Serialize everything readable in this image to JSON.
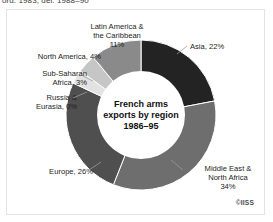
{
  "caption_above": "ord. 1983, del. 1988–90",
  "credit": "©IISS",
  "center": {
    "line1": "French arms",
    "line2": "exports by region",
    "line3": "1986–95"
  },
  "labels": {
    "latin": "Latin America &\nthe Caribbean\n11%",
    "north_america": "North America, 4%",
    "sub_saharan": "Sub-Saharan\nAfrica, 3%",
    "russia": "Russia &\nEurasia, 0%",
    "europe": "Europe, 26%",
    "asia": "Asia, 22%",
    "mena": "Middle East &\nNorth Africa\n34%"
  },
  "chart_data": {
    "type": "pie",
    "title": "French arms exports by region 1986–95",
    "subtitle": "",
    "xlabel": "",
    "ylabel": "",
    "donut": true,
    "legend_position": "outside-labels",
    "grid": false,
    "categories": [
      "Asia",
      "Middle East & North Africa",
      "Europe",
      "Russia & Eurasia",
      "Sub-Saharan Africa",
      "North America",
      "Latin America & the Caribbean"
    ],
    "values": [
      22,
      34,
      26,
      0,
      3,
      4,
      11
    ],
    "unit": "percent",
    "colors": [
      "#232323",
      "#6e6e6e",
      "#4f4f4f",
      "#9a9a9a",
      "#e2e2e2",
      "#c6c6c6",
      "#8a8a8a"
    ],
    "annotations": [
      "Asia, 22%",
      "Middle East & North Africa 34%",
      "Europe, 26%",
      "Russia & Eurasia, 0%",
      "Sub-Saharan Africa, 3%",
      "North America, 4%",
      "Latin America & the Caribbean 11%"
    ]
  }
}
